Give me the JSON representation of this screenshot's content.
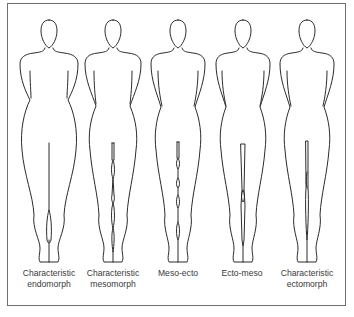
{
  "diagram": {
    "type": "somatotype-silhouettes",
    "stroke_color": "#2b2b2b",
    "border_color": "#6e6e6e",
    "figures": [
      {
        "id": "endo",
        "label_line1": "Characteristic",
        "label_line2": "endomorph"
      },
      {
        "id": "meso",
        "label_line1": "Characteristic",
        "label_line2": "mesomorph"
      },
      {
        "id": "meso-ecto",
        "label_line1": "Meso-ecto",
        "label_line2": ""
      },
      {
        "id": "ecto-meso",
        "label_line1": "Ecto-meso",
        "label_line2": ""
      },
      {
        "id": "ecto",
        "label_line1": "Characteristic",
        "label_line2": "ectomorph"
      }
    ]
  }
}
